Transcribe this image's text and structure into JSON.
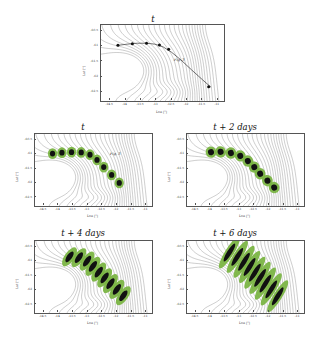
{
  "figure": {
    "background": "#ffffff",
    "contour_color": "#5a5a5a",
    "blob_fill": "#77b33f",
    "blob_core": "#111111",
    "track_color": "#333333"
  },
  "axes": {
    "xlabel": "Lon [°]",
    "ylabel": "Lat [°]",
    "xticks": [
      "-14.5",
      "-14",
      "-13.5",
      "-13",
      "-12.5",
      "-12",
      "-11.5",
      "-11"
    ],
    "xtick_values": [
      -14.5,
      -14,
      -13.5,
      -13,
      -12.5,
      -12,
      -11.5,
      -11
    ],
    "yticks": [
      "-60.5",
      "-61",
      "-61.5",
      "-62",
      "-62.5"
    ],
    "ytick_values": [
      -60.5,
      -61,
      -61.5,
      -62,
      -62.5
    ],
    "xlim": [
      -14.8,
      -10.8
    ],
    "ylim": [
      -62.8,
      -60.3
    ]
  },
  "panels": [
    {
      "id": "panel-top",
      "title": "t",
      "annotation": "Fig. 3",
      "marker_style": "dot-track",
      "description": "reference track with discrete particle markers"
    },
    {
      "id": "panel-t",
      "title": "t",
      "annotation": "Fig. 3",
      "marker_style": "circular-blobs",
      "description": "nine circular tracer patches along the track"
    },
    {
      "id": "panel-t2",
      "title": "t + 2 days",
      "annotation": "",
      "marker_style": "circular-blobs",
      "description": "nine slightly enlarged circular tracer patches"
    },
    {
      "id": "panel-t4",
      "title": "t + 4 days",
      "annotation": "",
      "marker_style": "sheared-blobs",
      "description": "nine sheared teardrop tracer patches"
    },
    {
      "id": "panel-t6",
      "title": "t + 6 days",
      "annotation": "",
      "marker_style": "filament-blobs",
      "description": "nine strongly stretched filamentary tracer patches"
    }
  ],
  "chart_data": {
    "type": "contour",
    "xlabel": "Lon [°]",
    "ylabel": "Lat [°]",
    "xlim": [
      -14.8,
      -10.8
    ],
    "ylim": [
      -62.8,
      -60.3
    ],
    "grid": false,
    "legend": "none",
    "contour_levels": 26,
    "series": [
      {
        "name": "t",
        "panel": "panel-top",
        "track_lon": [
          -14.25,
          -13.95,
          -13.62,
          -13.32,
          -13.05,
          -12.78,
          -12.5,
          -12.2,
          -11.85,
          -11.5,
          -11.22
        ],
        "track_lat": [
          -60.97,
          -60.93,
          -60.9,
          -60.9,
          -60.93,
          -61.02,
          -61.2,
          -61.45,
          -61.78,
          -62.1,
          -62.35
        ],
        "marker_lon": [
          -14.25,
          -13.78,
          -13.32,
          -12.9,
          -12.6,
          -11.3
        ],
        "marker_lat": [
          -60.97,
          -60.92,
          -60.9,
          -60.96,
          -61.1,
          -62.33
        ],
        "patch_radius_deg": 0.0
      },
      {
        "name": "t",
        "panel": "panel-t",
        "patch_lon": [
          -14.2,
          -13.88,
          -13.55,
          -13.22,
          -12.92,
          -12.68,
          -12.45,
          -12.18,
          -11.92
        ],
        "patch_lat": [
          -60.98,
          -60.95,
          -60.93,
          -60.94,
          -61.02,
          -61.2,
          -61.45,
          -61.72,
          -62.0
        ],
        "patch_radius_deg": 0.16,
        "patch_aspect": 1.0,
        "patch_angle_deg": 0
      },
      {
        "name": "t + 2 days",
        "panel": "panel-t2",
        "patch_lon": [
          -13.98,
          -13.65,
          -13.3,
          -12.98,
          -12.72,
          -12.5,
          -12.3,
          -12.05,
          -11.82
        ],
        "patch_lat": [
          -60.93,
          -60.92,
          -60.96,
          -61.06,
          -61.24,
          -61.45,
          -61.68,
          -61.92,
          -62.16
        ],
        "patch_radius_deg": 0.175,
        "patch_aspect": 1.05,
        "patch_angle_deg": -15
      },
      {
        "name": "t + 4 days",
        "panel": "panel-t4",
        "patch_lon": [
          -13.62,
          -13.3,
          -13.02,
          -12.82,
          -12.62,
          -12.42,
          -12.22,
          -12.0,
          -11.78
        ],
        "patch_lat": [
          -60.85,
          -60.88,
          -61.0,
          -61.18,
          -61.38,
          -61.58,
          -61.78,
          -61.98,
          -62.2
        ],
        "patch_radius_deg": 0.2,
        "patch_aspect": 1.9,
        "patch_angle_deg": -55
      },
      {
        "name": "t + 6 days",
        "panel": "panel-t6",
        "patch_lon": [
          -13.35,
          -13.08,
          -12.85,
          -12.66,
          -12.48,
          -12.3,
          -12.12,
          -11.92,
          -11.7
        ],
        "patch_lat": [
          -60.7,
          -60.85,
          -61.02,
          -61.2,
          -61.4,
          -61.58,
          -61.78,
          -61.98,
          -62.22
        ],
        "patch_radius_deg": 0.22,
        "patch_aspect": 2.9,
        "patch_angle_deg": -58
      }
    ]
  }
}
